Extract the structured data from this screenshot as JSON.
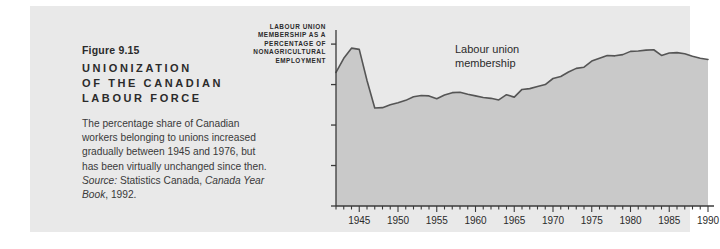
{
  "figure": {
    "number": "Figure 9.15",
    "title_line1": "UNIONIZATION",
    "title_line2": "OF THE CANADIAN",
    "title_line3": "LABOUR FORCE",
    "body_part1": "The percentage share of Canadian workers belonging to unions increased gradually between 1945 and 1976, but has been virtually unchanged since then. ",
    "source_label": "Source:",
    "body_part2": " Statistics Canada, ",
    "source_italic": "Canada Year Book",
    "body_part3": ", 1992."
  },
  "y_axis_caption": {
    "line1": "LABOUR UNION",
    "line2": "MEMBERSHIP AS A",
    "line3": "PERCENTAGE OF",
    "line4": "NONAGRICULTURAL",
    "line5": "EMPLOYMENT"
  },
  "annotation": {
    "line1": "Labour union",
    "line2": "membership"
  },
  "colors": {
    "page_background": "#ffffff",
    "panel_background": "#e9e9e9",
    "area_fill": "#c9c9c9",
    "line": "#555555",
    "axis": "#3a3a3a",
    "text": "#2b2b2b"
  },
  "chart_data": {
    "type": "area",
    "title": "Unionization of the Canadian Labour Force",
    "xlabel": "",
    "ylabel": "Labour union membership as a percentage of nonagricultural employment",
    "xlim": [
      1942,
      1990
    ],
    "ylim": [
      0,
      42
    ],
    "ytick_values": [
      0,
      10,
      20,
      30,
      40
    ],
    "ytick_labels": [
      "0",
      "10",
      "20",
      "30",
      "40"
    ],
    "xtick_major_values": [
      1945,
      1950,
      1955,
      1960,
      1965,
      1970,
      1975,
      1980,
      1985,
      1990
    ],
    "xtick_major_labels": [
      "1945",
      "1950",
      "1955",
      "1960",
      "1965",
      "1970",
      "1975",
      "1980",
      "1985",
      "1990"
    ],
    "xtick_minor_step": 1,
    "grid": false,
    "legend": false,
    "annotations": [
      {
        "text": "Labour union membership",
        "x": 1966,
        "y": 40
      }
    ],
    "series": [
      {
        "name": "Labour union membership",
        "x": [
          1942,
          1943,
          1944,
          1945,
          1946,
          1947,
          1948,
          1949,
          1950,
          1951,
          1952,
          1953,
          1954,
          1955,
          1956,
          1957,
          1958,
          1959,
          1960,
          1961,
          1962,
          1963,
          1964,
          1965,
          1966,
          1967,
          1968,
          1969,
          1970,
          1971,
          1972,
          1973,
          1974,
          1975,
          1976,
          1977,
          1978,
          1979,
          1980,
          1981,
          1982,
          1983,
          1984,
          1985,
          1986,
          1987,
          1988,
          1989,
          1990
        ],
        "values": [
          33.0,
          36.5,
          39.0,
          38.7,
          31.0,
          24.2,
          24.3,
          25.0,
          25.5,
          26.1,
          27.0,
          27.3,
          27.2,
          26.5,
          27.4,
          28.0,
          28.1,
          27.6,
          27.2,
          26.8,
          26.6,
          26.2,
          27.5,
          26.9,
          28.8,
          29.0,
          29.5,
          30.0,
          31.5,
          32.0,
          33.1,
          34.0,
          34.3,
          35.8,
          36.5,
          37.2,
          37.1,
          37.4,
          38.2,
          38.3,
          38.5,
          38.6,
          37.2,
          37.8,
          37.9,
          37.6,
          37.0,
          36.5,
          36.2
        ]
      }
    ]
  }
}
